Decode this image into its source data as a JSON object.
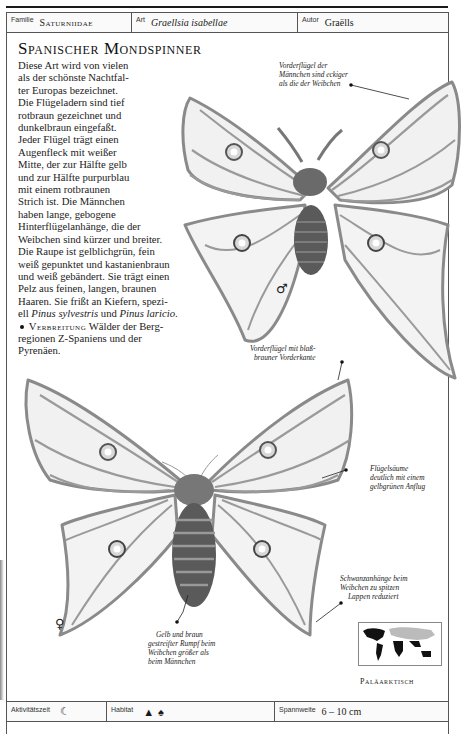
{
  "header": {
    "familie_label": "Familie",
    "familie_value": "Saturniidae",
    "art_label": "Art",
    "art_value": "Graellsia isabellae",
    "autor_label": "Autor",
    "autor_value": "Graëlls"
  },
  "title": "Spanischer Mondspinner",
  "body_lines": [
    "Diese Art wird von vielen",
    "als der schönste Nachtfal-",
    "ter Europas bezeichnet.",
    "Die Flügeladern sind tief",
    "rotbraun gezeichnet und",
    "dunkelbraun eingefaßt.",
    "Jeder Flügel trägt einen",
    "Augenfleck mit weißer",
    "Mitte, der zur Hälfte gelb",
    "und zur Hälfte purpurblau",
    "mit einem rotbraunen",
    "Strich ist. Die Männchen",
    "haben lange, gebogene",
    "Hinterflügelanhänge, die der",
    "Weibchen sind kürzer und breiter.",
    "Die Raupe ist gelblichgrün, fein",
    "weiß gepunktet und kastanienbraun",
    "und weiß gebändert. Sie trägt einen",
    "Pelz aus feinen, langen, braunen",
    "Haaren. Sie frißt an Kiefern, spezi-"
  ],
  "body_species_line": {
    "prefix": "ell ",
    "species1": "Pinus sylvestris",
    "mid": " und ",
    "species2": "Pinus laricio",
    "suffix": "."
  },
  "verbreitung": {
    "label": "Verbreitung",
    "line1": " Wälder der Berg-",
    "line2": "regionen Z-Spaniens und der",
    "line3": "Pyrenäen."
  },
  "annotations": {
    "male_forewing": [
      "Vorderflügel der",
      "Männchen sind eckiger",
      "als die der Weibchen"
    ],
    "forewing_edge": [
      "Vorderflügel mit blaß-",
      "brauner Vorderkante"
    ],
    "wing_margins": [
      "Flügelsäume",
      "deutlich mit einem",
      "gelbgrünen Anflug"
    ],
    "tail": [
      "Schwanzanhänge beim",
      "Weibchen zu spitzen",
      "Lappen reduziert"
    ],
    "body": [
      "Gelb und braun",
      "gestreifter Rumpf beim",
      "Weibchen größer als",
      "beim Männchen"
    ]
  },
  "sex_symbols": {
    "male": "♂",
    "female": "♀"
  },
  "map": {
    "region_label": "Paläarktisch",
    "icon": "world-map-icon"
  },
  "footer": {
    "activity_label": "Aktivitätszeit",
    "activity_icon": "☾",
    "habitat_label": "Habitat",
    "habitat_icons": [
      "▲",
      "♠"
    ],
    "span_label": "Spannweite",
    "span_value": "6 – 10 cm"
  },
  "colors": {
    "ink": "#1a1a1a",
    "wing_vein": "#8a8a8a",
    "wing_fill": "#f1f1f1",
    "body": "#555555"
  }
}
